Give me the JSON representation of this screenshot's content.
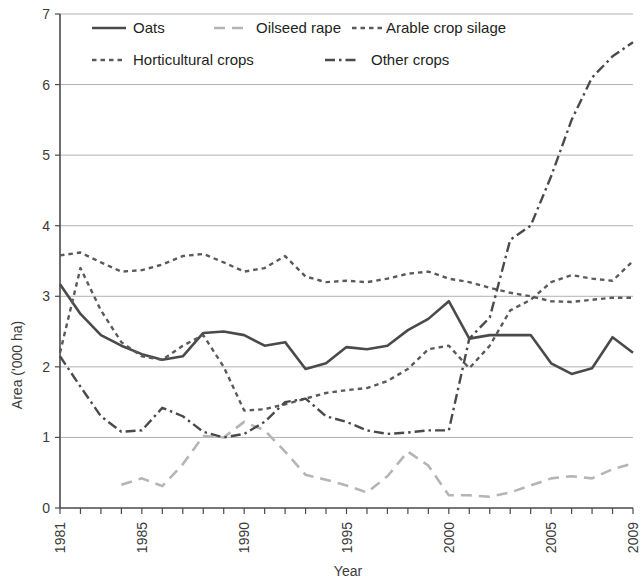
{
  "chart_data": {
    "type": "line",
    "title": "",
    "xlabel": "Year",
    "ylabel": "Area ('000 ha)",
    "xlim": [
      1981,
      2009
    ],
    "ylim": [
      0,
      7
    ],
    "ytick_labels": [
      "0",
      "1",
      "2",
      "3",
      "4",
      "5",
      "6",
      "7"
    ],
    "ytick_values": [
      0,
      1,
      2,
      3,
      4,
      5,
      6,
      7
    ],
    "xtick_labels": [
      "1981",
      "1985",
      "1990",
      "1995",
      "2000",
      "2005",
      "2009"
    ],
    "xtick_values": [
      1981,
      1985,
      1990,
      1995,
      2000,
      2005,
      2009
    ],
    "grid": "horizontal",
    "legend_position": "top-left-inside",
    "x": [
      1981,
      1982,
      1983,
      1984,
      1985,
      1986,
      1987,
      1988,
      1989,
      1990,
      1991,
      1992,
      1993,
      1994,
      1995,
      1996,
      1997,
      1998,
      1999,
      2000,
      2001,
      2002,
      2003,
      2004,
      2005,
      2006,
      2007,
      2008,
      2009
    ],
    "series": [
      {
        "name": "Oats",
        "style": "solid",
        "color": "#4a4a4a",
        "width": 2.6,
        "values": [
          3.17,
          2.75,
          2.45,
          2.3,
          2.18,
          2.1,
          2.15,
          2.48,
          2.5,
          2.45,
          2.3,
          2.35,
          1.97,
          2.05,
          2.28,
          2.25,
          2.3,
          2.52,
          2.68,
          2.93,
          2.4,
          2.45,
          2.45,
          2.45,
          2.05,
          1.9,
          1.98,
          2.42,
          2.2
        ]
      },
      {
        "name": "Oilseed rape",
        "style": "dashed-long",
        "color": "#b5b5b5",
        "width": 2.6,
        "values": [
          null,
          null,
          null,
          0.33,
          0.42,
          0.31,
          0.62,
          1.02,
          1.0,
          1.22,
          1.1,
          0.8,
          0.47,
          0.4,
          0.32,
          0.22,
          0.45,
          0.8,
          0.6,
          0.18,
          0.18,
          0.16,
          0.22,
          0.32,
          0.42,
          0.45,
          0.42,
          0.55,
          0.63
        ]
      },
      {
        "name": "Arable crop silage",
        "style": "dotted-fine",
        "color": "#5a5a5a",
        "width": 2.4,
        "values": [
          2.2,
          3.4,
          2.8,
          2.35,
          2.15,
          2.1,
          2.3,
          2.45,
          2.0,
          1.38,
          1.4,
          1.47,
          1.55,
          1.63,
          1.67,
          1.7,
          1.8,
          1.97,
          2.25,
          2.3,
          1.98,
          2.3,
          2.8,
          2.95,
          3.2,
          3.3,
          3.25,
          3.22,
          3.5
        ]
      },
      {
        "name": "Horticultural crops",
        "style": "dotted-fine",
        "color": "#5a5a5a",
        "width": 2.4,
        "values": [
          3.58,
          3.62,
          3.48,
          3.35,
          3.37,
          3.45,
          3.57,
          3.6,
          3.48,
          3.35,
          3.4,
          3.57,
          3.28,
          3.2,
          3.22,
          3.2,
          3.25,
          3.32,
          3.35,
          3.25,
          3.2,
          3.12,
          3.05,
          3.0,
          2.93,
          2.92,
          2.95,
          2.98,
          2.98
        ]
      },
      {
        "name": "Other crops",
        "style": "dashdot",
        "color": "#4a4a4a",
        "width": 2.4,
        "values": [
          2.15,
          1.72,
          1.3,
          1.08,
          1.1,
          1.42,
          1.3,
          1.08,
          1.0,
          1.05,
          1.22,
          1.5,
          1.55,
          1.3,
          1.22,
          1.1,
          1.05,
          1.07,
          1.1,
          1.1,
          2.4,
          2.7,
          3.8,
          4.0,
          4.7,
          5.5,
          6.1,
          6.4,
          6.6
        ]
      }
    ]
  },
  "legend": {
    "items": [
      {
        "label": "Oats",
        "key": "oats"
      },
      {
        "label": "Oilseed rape",
        "key": "oilseed-rape"
      },
      {
        "label": "Arable crop silage",
        "key": "arable-crop-silage"
      },
      {
        "label": "Horticultural crops",
        "key": "horticultural-crops"
      },
      {
        "label": "Other crops",
        "key": "other-crops"
      }
    ]
  }
}
